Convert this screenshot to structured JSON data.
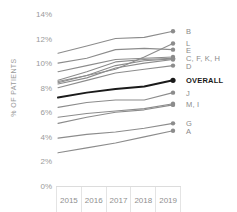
{
  "chart_data": {
    "type": "line",
    "title": "",
    "xlabel": "",
    "ylabel": "% OF PATIENTS",
    "categories": [
      "2015",
      "2016",
      "2017",
      "2018",
      "2019"
    ],
    "x": [
      2015,
      2016,
      2017,
      2018,
      2019
    ],
    "ylim": [
      0,
      14
    ],
    "ytick_labels": [
      "0%",
      "2%",
      "4%",
      "6%",
      "8%",
      "10%",
      "12%",
      "14%"
    ],
    "ytick_values": [
      0,
      2,
      4,
      6,
      8,
      10,
      12,
      14
    ],
    "grid": false,
    "legend_position": "right-endpoint",
    "endpoint_markers": true,
    "colors": {
      "series_line": "#8c8c8c",
      "highlight_line": "#1a1a1a",
      "axis_text": "#8f8f8f",
      "axis_rule": "#dcdcdc",
      "background": "#ffffff"
    },
    "series": [
      {
        "name": "B",
        "label": "B",
        "values": [
          10.8,
          11.4,
          12.0,
          12.1,
          12.6
        ],
        "highlight": false
      },
      {
        "name": "L",
        "label": "L",
        "values": [
          8.5,
          9.0,
          9.5,
          10.5,
          11.6
        ],
        "highlight": false
      },
      {
        "name": "E",
        "label": "E",
        "values": [
          10.0,
          10.4,
          11.1,
          11.2,
          11.1
        ],
        "highlight": false
      },
      {
        "name": "C",
        "label": "C, F, K, H",
        "values": [
          9.3,
          9.8,
          10.3,
          10.4,
          10.5
        ],
        "highlight": false
      },
      {
        "name": "F",
        "label": "",
        "values": [
          8.6,
          9.3,
          10.1,
          10.3,
          10.4
        ],
        "highlight": false
      },
      {
        "name": "K",
        "label": "",
        "values": [
          8.4,
          9.0,
          9.8,
          10.2,
          10.35
        ],
        "highlight": false
      },
      {
        "name": "H",
        "label": "",
        "values": [
          8.3,
          8.8,
          9.6,
          10.0,
          10.3
        ],
        "highlight": false
      },
      {
        "name": "D",
        "label": "D",
        "values": [
          8.0,
          8.6,
          9.2,
          9.5,
          9.8
        ],
        "highlight": false
      },
      {
        "name": "OVERALL",
        "label": "OVERALL",
        "values": [
          7.2,
          7.6,
          7.9,
          8.1,
          8.6
        ],
        "highlight": true
      },
      {
        "name": "J",
        "label": "J",
        "values": [
          6.4,
          6.8,
          7.0,
          7.0,
          7.6
        ],
        "highlight": false
      },
      {
        "name": "M",
        "label": "M, I",
        "values": [
          5.6,
          5.9,
          6.1,
          6.3,
          6.7
        ],
        "highlight": false
      },
      {
        "name": "I",
        "label": "",
        "values": [
          5.1,
          5.6,
          6.0,
          6.2,
          6.6
        ],
        "highlight": false
      },
      {
        "name": "G",
        "label": "G",
        "values": [
          3.9,
          4.2,
          4.4,
          4.7,
          5.1
        ],
        "highlight": false
      },
      {
        "name": "A",
        "label": "A",
        "values": [
          2.7,
          3.1,
          3.5,
          4.0,
          4.5
        ],
        "highlight": false
      }
    ],
    "legend_entries": [
      {
        "label": "B",
        "value": 12.6,
        "highlight": false
      },
      {
        "label": "L",
        "value": 11.6,
        "highlight": false
      },
      {
        "label": "E",
        "value": 11.1,
        "highlight": false
      },
      {
        "label": "C, F, K, H",
        "value": 10.4,
        "highlight": false
      },
      {
        "label": "D",
        "value": 9.8,
        "highlight": false
      },
      {
        "label": "OVERALL",
        "value": 8.6,
        "highlight": true
      },
      {
        "label": "J",
        "value": 7.6,
        "highlight": false
      },
      {
        "label": "M, I",
        "value": 6.65,
        "highlight": false
      },
      {
        "label": "G",
        "value": 5.1,
        "highlight": false
      },
      {
        "label": "A",
        "value": 4.5,
        "highlight": false
      }
    ]
  }
}
